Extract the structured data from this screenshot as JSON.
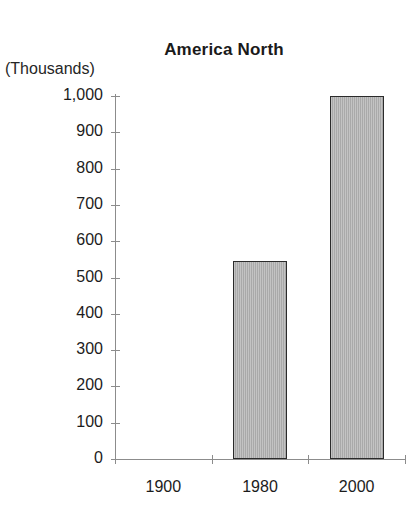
{
  "chart_data": {
    "type": "bar",
    "title": "America North",
    "xlabel": "",
    "ylabel": "(Thousands)",
    "categories": [
      "1900",
      "1980",
      "2000"
    ],
    "values": [
      0,
      545,
      1000
    ],
    "ylim": [
      0,
      1000
    ],
    "ytick_values": [
      0,
      100,
      200,
      300,
      400,
      500,
      600,
      700,
      800,
      900,
      1000
    ],
    "ytick_labels": [
      "0",
      "100",
      "200",
      "300",
      "400",
      "500",
      "600",
      "700",
      "800",
      "900",
      "1,000"
    ],
    "grid": false,
    "legend": null,
    "series": [
      {
        "name": "America North",
        "values": [
          0,
          545,
          1000
        ]
      }
    ],
    "bar_fill_color": "#a9a9a9",
    "bar_border_color": "#2b2b2b",
    "axis_color": "#8c8c8c",
    "text_color": "#1c1c1c"
  }
}
